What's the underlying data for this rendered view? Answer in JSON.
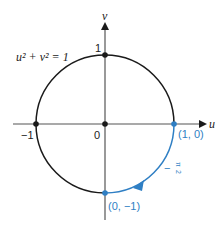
{
  "diagram": {
    "equation_label": "u² + v² = 1",
    "axes": {
      "horizontal_label": "u",
      "vertical_label": "v"
    },
    "tick_labels": {
      "v_one": "1",
      "u_neg_one": "−1",
      "origin": "0"
    },
    "points": [
      {
        "name": "top",
        "label": "",
        "u": 0,
        "v": 1,
        "color": "#1a1a1a"
      },
      {
        "name": "left",
        "label": "",
        "u": -1,
        "v": 0,
        "color": "#1a1a1a"
      },
      {
        "name": "origin",
        "label": "",
        "u": 0,
        "v": 0,
        "color": "#1a1a1a"
      },
      {
        "name": "right",
        "label": "(1, 0)",
        "u": 1,
        "v": 0,
        "color": "#2f7fc4"
      },
      {
        "name": "bottom",
        "label": "(0, −1)",
        "u": 0,
        "v": -1,
        "color": "#2f7fc4"
      }
    ],
    "arc": {
      "from": "(1, 0)",
      "to": "(0, −1)",
      "direction": "clockwise",
      "angle_label": "−π/2",
      "angle_numerator": "π",
      "angle_denominator": "2",
      "angle_sign": "−",
      "color": "#2f7fc4"
    },
    "colors": {
      "circle": "#1a1a1a",
      "axes": "#555555",
      "accent": "#2f7fc4"
    }
  }
}
